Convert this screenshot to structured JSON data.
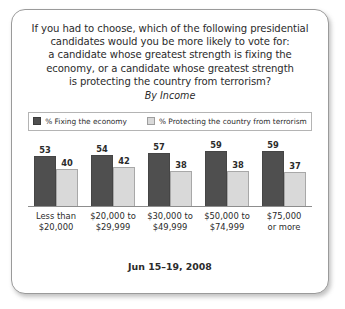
{
  "card": {
    "title_lines": [
      "If you had to choose, which of the following presidential",
      "candidates would you be more likely to vote for:",
      "a candidate whose greatest strength is fixing the",
      "economy, or a candidate whose greatest strength",
      "is protecting the country from terrorism?"
    ],
    "subtitle": "By Income",
    "footer": "Jun 15–19, 2008"
  },
  "chart_data": {
    "type": "bar",
    "subtitle": "By Income",
    "xlabel": "",
    "ylabel": "",
    "ylim": [
      0,
      65
    ],
    "grid": false,
    "legend_position": "top",
    "annotation": "Jun 15–19, 2008",
    "categories": [
      "Less than $20,000",
      "$20,000 to $29,999",
      "$30,000 to $49,999",
      "$50,000 to $74,999",
      "$75,000 or more"
    ],
    "category_lines": [
      [
        "Less than",
        "$20,000"
      ],
      [
        "$20,000 to",
        "$29,999"
      ],
      [
        "$30,000 to",
        "$49,999"
      ],
      [
        "$50,000 to",
        "$74,999"
      ],
      [
        "$75,000",
        "or more"
      ]
    ],
    "series": [
      {
        "name": "% Fixing the economy",
        "color": "#4f4f4f",
        "values": [
          53,
          54,
          57,
          59,
          59
        ]
      },
      {
        "name": "% Protecting the country from terrorism",
        "color": "#d9d9d9",
        "values": [
          40,
          42,
          38,
          38,
          37
        ]
      }
    ]
  }
}
